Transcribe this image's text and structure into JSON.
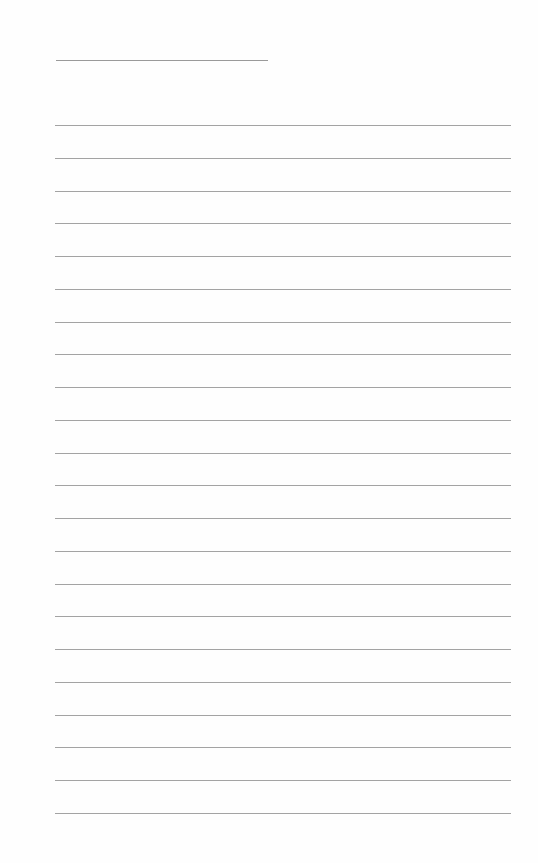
{
  "page": {
    "type": "lined-paper",
    "background_color": "#fefefe",
    "line_color": "#a3a3a3",
    "title_line": {
      "present": true
    },
    "line_count": 22
  }
}
